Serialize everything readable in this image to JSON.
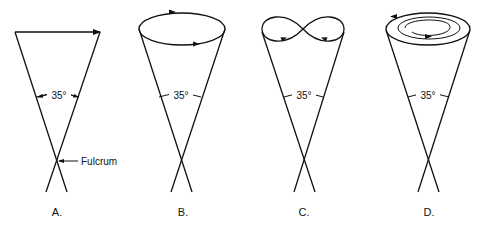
{
  "figure": {
    "panels": [
      {
        "label": "A.",
        "motion": "linear sweep",
        "angle_label": "35°",
        "annotation": "Fulcrum"
      },
      {
        "label": "B.",
        "motion": "circular",
        "angle_label": "35°"
      },
      {
        "label": "C.",
        "motion": "figure-eight",
        "angle_label": "35°"
      },
      {
        "label": "D.",
        "motion": "spiral",
        "angle_label": "35°"
      }
    ]
  },
  "colors": {
    "stroke": "#111111",
    "background": "#ffffff"
  }
}
